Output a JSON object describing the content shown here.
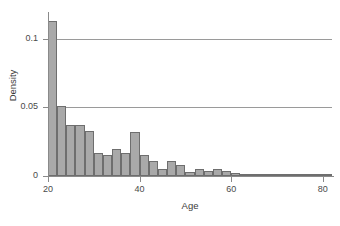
{
  "chart_data": {
    "type": "bar",
    "title": "",
    "subtitle": "",
    "xlabel": "Age",
    "ylabel": "Density",
    "xlim": [
      20,
      82
    ],
    "ylim": [
      0,
      0.118
    ],
    "grid": "horizontal",
    "legend": "none",
    "bin_width": 2,
    "x_ticks": [
      {
        "value": 20,
        "label": "20"
      },
      {
        "value": 40,
        "label": "40"
      },
      {
        "value": 60,
        "label": "60"
      },
      {
        "value": 80,
        "label": "80"
      }
    ],
    "y_ticks": [
      {
        "value": 0,
        "label": "0"
      },
      {
        "value": 0.05,
        "label": "0.05"
      },
      {
        "value": 0.1,
        "label": "0.1"
      }
    ],
    "gridline_values": [
      0.05,
      0.1
    ],
    "bin_starts": [
      20,
      22,
      24,
      26,
      28,
      30,
      32,
      34,
      36,
      38,
      40,
      42,
      44,
      46,
      48,
      50,
      52,
      54,
      56,
      58,
      60,
      62,
      64,
      66,
      68,
      70,
      72,
      74,
      76,
      78,
      80
    ],
    "categories": [
      "20-22",
      "22-24",
      "24-26",
      "26-28",
      "28-30",
      "30-32",
      "32-34",
      "34-36",
      "36-38",
      "38-40",
      "40-42",
      "42-44",
      "44-46",
      "46-48",
      "48-50",
      "50-52",
      "52-54",
      "54-56",
      "56-58",
      "58-60",
      "60-62",
      "62-64",
      "64-66",
      "66-68",
      "68-70",
      "70-72",
      "72-74",
      "74-76",
      "76-78",
      "78-80",
      "80-82"
    ],
    "values": [
      0.113,
      0.051,
      0.037,
      0.037,
      0.033,
      0.017,
      0.015,
      0.02,
      0.017,
      0.032,
      0.015,
      0.011,
      0.005,
      0.011,
      0.008,
      0.003,
      0.005,
      0.004,
      0.005,
      0.004,
      0.002,
      0.001,
      0.0,
      0.0,
      0.0,
      0.0,
      0.0,
      0.0,
      0.001,
      0.0,
      0.0
    ],
    "colors": {
      "bar_fill": "#a9a9a9",
      "bar_border": "#6e6e6e",
      "gridline": "#9a9a9a",
      "axis": "#8a8a8a",
      "background": "#ffffff",
      "text": "#3a3a3a"
    }
  }
}
